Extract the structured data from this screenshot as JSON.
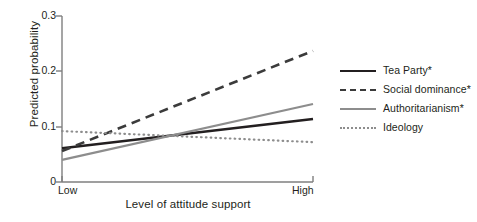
{
  "chart_data": {
    "type": "line",
    "title": "",
    "xlabel": "Level of attitude support",
    "ylabel": "Predicted probability",
    "x": [
      "Low",
      "High"
    ],
    "xtick_labels": [
      "Low",
      "High"
    ],
    "ytick_labels": [
      "0",
      "0.1",
      "0.2",
      "0.3"
    ],
    "ytick_values": [
      0,
      0.1,
      0.2,
      0.3
    ],
    "ylim": [
      0,
      0.3
    ],
    "xlim": [
      0,
      1
    ],
    "grid": false,
    "legend_position": "right",
    "series": [
      {
        "name": "Tea Party*",
        "values": [
          0.061,
          0.114
        ],
        "style": "solid",
        "color": "#231f20",
        "width": 2.6
      },
      {
        "name": "Social dominance*",
        "values": [
          0.056,
          0.237
        ],
        "style": "dashed",
        "color": "#3b3b3b",
        "width": 2.6
      },
      {
        "name": "Authoritarianism*",
        "values": [
          0.04,
          0.141
        ],
        "style": "solid",
        "color": "#8d8d8d",
        "width": 2.2
      },
      {
        "name": "Ideology",
        "values": [
          0.092,
          0.072
        ],
        "style": "dotted",
        "color": "#8d8d8d",
        "width": 2.2
      }
    ]
  },
  "axis": {
    "ylabel": "Predicted probability",
    "xlabel": "Level of attitude support",
    "yticks": [
      "0.3",
      "0.2",
      "0.1",
      "0"
    ],
    "xticks": [
      "Low",
      "High"
    ],
    "axis_color": "#7f7f7f"
  },
  "legend": {
    "items": [
      {
        "label": "Tea Party*"
      },
      {
        "label": "Social dominance*"
      },
      {
        "label": "Authoritarianism*"
      },
      {
        "label": "Ideology"
      }
    ]
  }
}
